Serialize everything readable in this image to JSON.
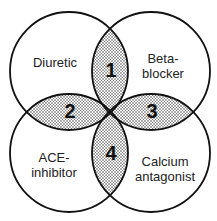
{
  "diagram": {
    "type": "venn-four-circles",
    "circles": [
      {
        "id": "diuretic",
        "lines": [
          "Diuretic"
        ]
      },
      {
        "id": "beta-blocker",
        "lines": [
          "Beta-",
          "blocker"
        ]
      },
      {
        "id": "ace-inhibitor",
        "lines": [
          "ACE-",
          "inhibitor"
        ]
      },
      {
        "id": "calcium-antagonist",
        "lines": [
          "Calcium",
          "antagonist"
        ]
      }
    ],
    "overlaps": [
      {
        "number": "1",
        "between": [
          "Diuretic",
          "Beta-blocker"
        ]
      },
      {
        "number": "2",
        "between": [
          "Diuretic",
          "ACE-inhibitor"
        ]
      },
      {
        "number": "3",
        "between": [
          "Beta-blocker",
          "Calcium antagonist"
        ]
      },
      {
        "number": "4",
        "between": [
          "ACE-inhibitor",
          "Calcium antagonist"
        ]
      }
    ],
    "colors": {
      "stroke": "#111111",
      "overlap_fill": "#cccccc",
      "background": "#ffffff"
    }
  }
}
